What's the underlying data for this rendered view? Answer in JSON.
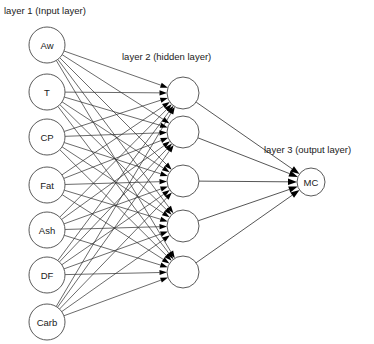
{
  "diagram": {
    "background_color": "#ffffff",
    "node_stroke_color": "#5a5a5a",
    "edge_color": "#2b2b2b",
    "arrow_color": "#000000",
    "text_color": "#1a1a1a"
  },
  "captions": {
    "input": "layer 1 (Input layer)",
    "hidden": "layer 2 (hidden layer)",
    "output": "layer 3 (output layer)"
  },
  "layers": {
    "input": {
      "name": "input-layer",
      "count": 7,
      "cx": 47,
      "r": 18,
      "nodes": [
        {
          "label": "Aw",
          "cy": 45
        },
        {
          "label": "T",
          "cy": 92
        },
        {
          "label": "CP",
          "cy": 137
        },
        {
          "label": "Fat",
          "cy": 185
        },
        {
          "label": "Ash",
          "cy": 230
        },
        {
          "label": "DF",
          "cy": 275
        },
        {
          "label": "Carb",
          "cy": 322
        }
      ]
    },
    "hidden": {
      "name": "hidden-layer",
      "count": 5,
      "cx": 183,
      "r": 16,
      "nodes": [
        {
          "label": "",
          "cy": 93
        },
        {
          "label": "",
          "cy": 132
        },
        {
          "label": "",
          "cy": 181
        },
        {
          "label": "",
          "cy": 226
        },
        {
          "label": "",
          "cy": 272
        }
      ]
    },
    "output": {
      "name": "output-layer",
      "count": 1,
      "cx": 311,
      "r": 14,
      "nodes": [
        {
          "label": "MC",
          "cy": 182
        }
      ]
    }
  },
  "caption_positions": {
    "input": {
      "x": 4,
      "y": 14
    },
    "hidden": {
      "x": 122,
      "y": 60
    },
    "output": {
      "x": 264,
      "y": 153
    }
  },
  "connections": {
    "input_to_hidden_count": 35,
    "hidden_to_output_count": 5,
    "fully_connected": true
  }
}
